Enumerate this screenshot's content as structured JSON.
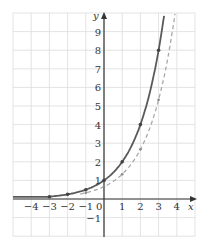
{
  "chart_data": {
    "type": "line",
    "title": "",
    "xlabel": "x",
    "ylabel": "y",
    "xlim": [
      -5,
      5
    ],
    "ylim": [
      -2,
      10
    ],
    "grid": true,
    "legend": null,
    "x_ticks": [
      "-4",
      "-3",
      "-2",
      "-1",
      "0",
      "1",
      "2",
      "3",
      "4"
    ],
    "y_ticks": [
      "-1",
      "1",
      "2",
      "3",
      "4",
      "5",
      "6",
      "7",
      "8",
      "9"
    ],
    "series": [
      {
        "name": "solid curve (y = 2^x)",
        "style": "solid",
        "color": "#5a5a5a",
        "points": [
          {
            "x": -3,
            "y": 0.125
          },
          {
            "x": -2,
            "y": 0.25
          },
          {
            "x": -1,
            "y": 0.5
          },
          {
            "x": 0,
            "y": 1
          },
          {
            "x": 1,
            "y": 2
          },
          {
            "x": 2,
            "y": 4
          },
          {
            "x": 3,
            "y": 8
          }
        ]
      },
      {
        "name": "dashed curve (y = 2^x / 1.5)",
        "style": "dashed",
        "color": "#a8a8a8",
        "points": [
          {
            "x": -1,
            "y": 0.33
          },
          {
            "x": 0,
            "y": 0.67
          },
          {
            "x": 1,
            "y": 1.33
          },
          {
            "x": 2,
            "y": 2.67
          },
          {
            "x": 3,
            "y": 5.33
          }
        ]
      }
    ]
  },
  "colors": {
    "grid": "#dcdcdc",
    "axis": "#333333"
  }
}
